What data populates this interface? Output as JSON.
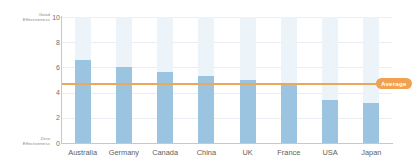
{
  "chart_data": {
    "type": "bar",
    "title": "",
    "xlabel": "",
    "ylabel": "",
    "categories": [
      "Australia",
      "Germany",
      "Canada",
      "China",
      "UK",
      "France",
      "USA",
      "Japan"
    ],
    "values": [
      6.6,
      6.0,
      5.6,
      5.3,
      5.0,
      4.6,
      3.45,
      3.2
    ],
    "series": [
      {
        "name": "Effectiveness",
        "values": [
          6.6,
          6.0,
          5.6,
          5.3,
          5.0,
          4.6,
          3.45,
          3.2
        ]
      }
    ],
    "ylim": [
      0,
      10
    ],
    "y_ticks": [
      "10",
      "8",
      "6",
      "4",
      "2",
      "0"
    ],
    "y_tick_values": [
      10,
      8,
      6,
      4,
      2,
      0
    ],
    "grid": true,
    "legend_position": "none",
    "annotations": {
      "axis_top_label": "Good\nEffectiveness",
      "axis_top_label_line1": "Good",
      "axis_top_label_line2": "Effectiveness",
      "axis_bottom_label_line1": "Zero",
      "axis_bottom_label_line2": "Effectiveness",
      "average_label": "Average",
      "average_value": 4.75
    },
    "colors": {
      "bar_fill": "#9ac4e0",
      "bar_background": "#edf4f9",
      "average_line": "#e9a85c",
      "average_badge": "#f0a152",
      "gridline": "#e8eef3",
      "axis_line": "#c8c8c8",
      "text": "#5e5e5e",
      "plot_background": "#ffffff"
    }
  }
}
